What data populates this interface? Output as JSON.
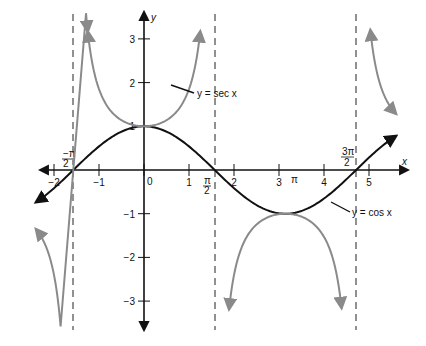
{
  "chart_data": {
    "type": "line",
    "title": "",
    "xlabel": "x",
    "ylabel": "y",
    "xlim": [
      -2.4,
      5.6
    ],
    "ylim": [
      -3.6,
      3.6
    ],
    "grid": false,
    "x_ticks": [
      {
        "value": -2,
        "label": "−2"
      },
      {
        "value": -1,
        "label": "−1"
      },
      {
        "value": 0,
        "label": "0"
      },
      {
        "value": 1,
        "label": "1"
      },
      {
        "value": 2,
        "label": "2"
      },
      {
        "value": 3,
        "label": "3"
      },
      {
        "value": 4,
        "label": "4"
      },
      {
        "value": 5,
        "label": "5"
      }
    ],
    "y_ticks": [
      {
        "value": 3,
        "label": "3"
      },
      {
        "value": 2,
        "label": "2"
      },
      {
        "value": 1,
        "label": "1"
      },
      {
        "value": -1,
        "label": "−1"
      },
      {
        "value": -2,
        "label": "−2"
      },
      {
        "value": -3,
        "label": "−3"
      }
    ],
    "special_x_labels": [
      {
        "value": -1.5708,
        "numerator": "−π",
        "denominator": "2"
      },
      {
        "value": 1.5708,
        "numerator": "π",
        "denominator": "2"
      },
      {
        "value": 3.1416,
        "label": "π"
      },
      {
        "value": 4.7124,
        "numerator": "3π",
        "denominator": "2"
      }
    ],
    "asymptotes": [
      -1.5708,
      1.5708,
      4.7124
    ],
    "series": [
      {
        "name": "y = cos x",
        "function": "cos",
        "color": "#111111",
        "x_range": [
          -2.4,
          5.6
        ]
      },
      {
        "name": "y = sec x",
        "function": "sec",
        "color": "#8a8a8a",
        "branches": [
          [
            -2.4,
            -1.25
          ],
          [
            -1.25,
            1.25
          ],
          [
            1.89,
            4.39
          ],
          [
            5.03,
            5.6
          ]
        ]
      }
    ],
    "annotations": [
      {
        "text": "y = sec x",
        "points_to": [
          0.6,
          1.2
        ]
      },
      {
        "text": "y = cos x",
        "points_to": [
          3.9,
          -0.72
        ]
      }
    ]
  },
  "labels": {
    "x_axis": "x",
    "y_axis": "y",
    "sec_label": "y = sec x",
    "cos_label": "y = cos x",
    "neg_pi": "−π",
    "pi": "π",
    "three_pi": "3π",
    "two": "2",
    "pi_single": "π"
  }
}
